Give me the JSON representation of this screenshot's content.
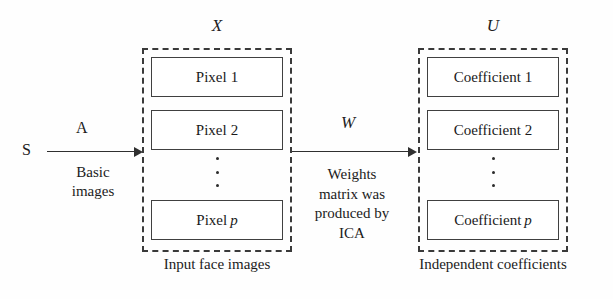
{
  "figure": {
    "type": "ica-pipeline-block-diagram",
    "background_color": "#fefefe",
    "line_color": "#2f2f2f"
  },
  "source": {
    "label": "S",
    "arrow": {
      "symbol": "A",
      "caption_line_1": "Basic",
      "caption_line_2": "images"
    }
  },
  "input_group": {
    "symbol": "X",
    "caption": "Input face images",
    "items": [
      {
        "name": "Pixel",
        "index": "1",
        "index_italic": false
      },
      {
        "name": "Pixel",
        "index": "2",
        "index_italic": false
      },
      {
        "name": "Pixel",
        "index": "p",
        "index_italic": true
      }
    ],
    "ellipsis": "vertical-dots"
  },
  "transform": {
    "symbol": "W",
    "caption_lines": [
      "Weights",
      "matrix was",
      "produced by",
      "ICA"
    ]
  },
  "output_group": {
    "symbol": "U",
    "caption": "Independent coefficients",
    "items": [
      {
        "name": "Coefficient",
        "index": "1",
        "index_italic": false
      },
      {
        "name": "Coefficient",
        "index": "2",
        "index_italic": false
      },
      {
        "name": "Coefficient",
        "index": "p",
        "index_italic": true
      }
    ],
    "ellipsis": "vertical-dots"
  }
}
